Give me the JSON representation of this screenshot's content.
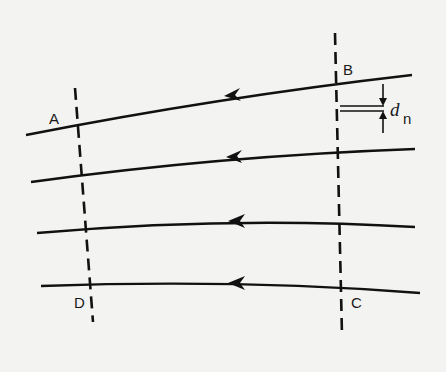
{
  "diagram": {
    "type": "flow lines with control surfaces",
    "stroke_color": "#111111",
    "background_color": "#f3f3f1",
    "points": [
      {
        "id": "A",
        "label": "A"
      },
      {
        "id": "B",
        "label": "B"
      },
      {
        "id": "C",
        "label": "C"
      },
      {
        "id": "D",
        "label": "D"
      }
    ],
    "spacing_label": {
      "symbol": "d",
      "subscript": "n"
    },
    "flow_lines": [
      {
        "id": "line-1",
        "direction": "right-to-left"
      },
      {
        "id": "line-2",
        "direction": "right-to-left"
      },
      {
        "id": "line-3",
        "direction": "right-to-left"
      },
      {
        "id": "line-4",
        "direction": "right-to-left"
      }
    ],
    "dashed_lines": [
      {
        "id": "left-boundary",
        "endpoints": [
          "A",
          "D"
        ]
      },
      {
        "id": "right-boundary",
        "endpoints": [
          "B",
          "C"
        ]
      }
    ]
  }
}
